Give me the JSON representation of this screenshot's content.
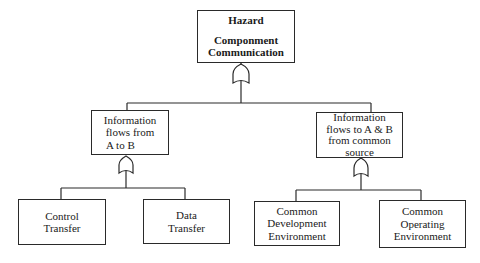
{
  "diagram": {
    "type": "fault-tree",
    "root": {
      "title": "Hazard",
      "line1": "Componment",
      "line2": "Communication",
      "gate": "or-gate"
    },
    "branches": [
      {
        "label_lines": [
          "Information",
          "flows from",
          "A to B"
        ],
        "gate": "or-gate",
        "children": [
          {
            "label_lines": [
              "Control",
              "Transfer"
            ]
          },
          {
            "label_lines": [
              "Data",
              "Transfer"
            ]
          }
        ]
      },
      {
        "label_lines": [
          "Information",
          "flows to A & B",
          "from common",
          "source"
        ],
        "gate": "or-gate",
        "children": [
          {
            "label_lines": [
              "Common",
              "Development",
              "Environment"
            ]
          },
          {
            "label_lines": [
              "Common",
              "Operating",
              "Environment"
            ]
          }
        ]
      }
    ],
    "colors": {
      "line": "#2a2a2a",
      "background": "#ffffff"
    }
  }
}
